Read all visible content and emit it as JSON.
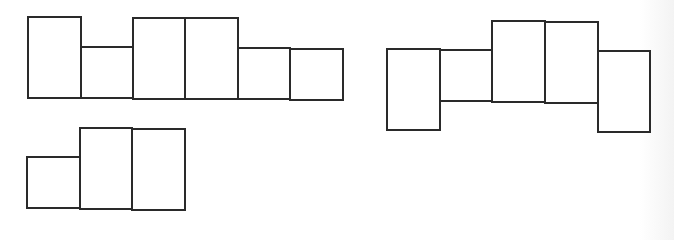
{
  "diagram": {
    "title": "",
    "stroke_color": "#2a2a2a",
    "fill_color": "#ffffff",
    "figures": [
      {
        "id": "net-1",
        "cells": [
          {
            "x": 28,
            "y": 17,
            "w": 53,
            "h": 81
          },
          {
            "x": 81,
            "y": 47,
            "w": 52,
            "h": 51
          },
          {
            "x": 133,
            "y": 18,
            "w": 52,
            "h": 81
          },
          {
            "x": 185,
            "y": 18,
            "w": 53,
            "h": 81
          },
          {
            "x": 238,
            "y": 48,
            "w": 52,
            "h": 51
          },
          {
            "x": 290,
            "y": 49,
            "w": 53,
            "h": 51
          }
        ]
      },
      {
        "id": "net-2",
        "cells": [
          {
            "x": 387,
            "y": 49,
            "w": 53,
            "h": 81
          },
          {
            "x": 440,
            "y": 50,
            "w": 52,
            "h": 51
          },
          {
            "x": 492,
            "y": 21,
            "w": 53,
            "h": 81
          },
          {
            "x": 545,
            "y": 22,
            "w": 53,
            "h": 81
          },
          {
            "x": 598,
            "y": 51,
            "w": 52,
            "h": 81
          }
        ]
      },
      {
        "id": "net-3",
        "cells": [
          {
            "x": 27,
            "y": 157,
            "w": 53,
            "h": 51
          },
          {
            "x": 80,
            "y": 128,
            "w": 52,
            "h": 81
          },
          {
            "x": 132,
            "y": 129,
            "w": 53,
            "h": 81
          }
        ]
      }
    ]
  }
}
